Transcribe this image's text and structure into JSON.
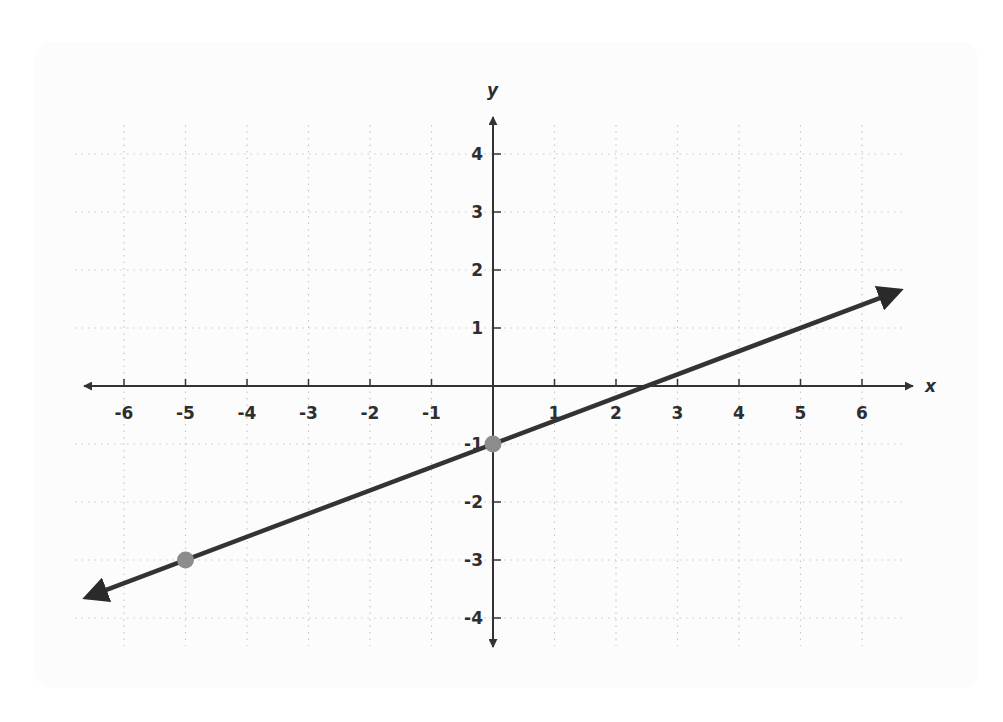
{
  "chart_data": {
    "type": "line",
    "title": "",
    "xlabel": "x",
    "ylabel": "y",
    "xlim": [
      -6.6,
      6.6
    ],
    "ylim": [
      -4.4,
      4.6
    ],
    "grid": true,
    "legend": null,
    "x_ticks": [
      -6,
      -5,
      -4,
      -3,
      -2,
      -1,
      1,
      2,
      3,
      4,
      5,
      6
    ],
    "x_tick_labels": [
      "-6",
      "-5",
      "-4",
      "-3",
      "-2",
      "-1",
      "1",
      "2",
      "3",
      "4",
      "5",
      "6"
    ],
    "y_ticks": [
      4,
      3,
      2,
      1,
      -1,
      -2,
      -3,
      -4
    ],
    "y_tick_labels": [
      "4",
      "3",
      "2",
      "1",
      "-1",
      "-2",
      "-3",
      "-4"
    ],
    "series": [
      {
        "name": "line",
        "equation": "y = 0.4x - 1",
        "slope": 0.4,
        "intercept": -1,
        "x": [
          -6.6,
          6.6
        ],
        "y": [
          -3.64,
          1.64
        ],
        "arrows_both_ends": true,
        "color": "#333333"
      }
    ],
    "points": [
      {
        "x": -5,
        "y": -3,
        "color": "#8c8c8c"
      },
      {
        "x": 0,
        "y": -1,
        "color": "#8c8c8c"
      }
    ]
  },
  "style": {
    "axis_color": "#333333",
    "grid_color": "#c8c8c8",
    "line_color": "#333333",
    "point_color": "#8c8c8c",
    "card_color": "#fcfcfc"
  }
}
